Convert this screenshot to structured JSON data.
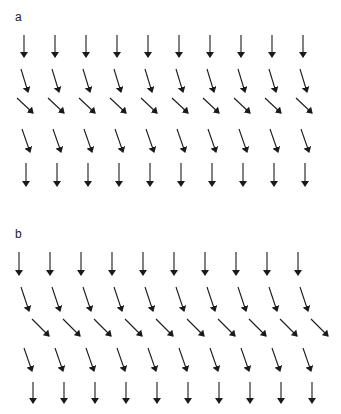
{
  "panels": [
    {
      "label": "a",
      "label_pos": [
        15,
        11
      ],
      "columns": 10,
      "rows": [
        {
          "x0": 24,
          "y0": 35,
          "dx": 0,
          "dy": 22,
          "spacing": 31
        },
        {
          "x0": 21,
          "y0": 69,
          "dx": 7,
          "dy": 23,
          "spacing": 31
        },
        {
          "x0": 17,
          "y0": 98,
          "dx": 16,
          "dy": 15,
          "spacing": 31
        },
        {
          "x0": 22,
          "y0": 129,
          "dx": 8,
          "dy": 23,
          "spacing": 31
        },
        {
          "x0": 26,
          "y0": 163,
          "dx": 0,
          "dy": 23,
          "spacing": 31
        }
      ]
    },
    {
      "label": "b",
      "label_pos": [
        15,
        228
      ],
      "columns": 10,
      "rows": [
        {
          "x0": 19,
          "y0": 252,
          "dx": 0,
          "dy": 23,
          "spacing": 31
        },
        {
          "x0": 21,
          "y0": 287,
          "dx": 8,
          "dy": 24,
          "spacing": 31
        },
        {
          "x0": 32,
          "y0": 319,
          "dx": 17,
          "dy": 17,
          "spacing": 31
        },
        {
          "x0": 24,
          "y0": 348,
          "dx": 8,
          "dy": 23,
          "spacing": 31
        },
        {
          "x0": 33,
          "y0": 382,
          "dx": 0,
          "dy": 21,
          "spacing": 31
        }
      ]
    }
  ],
  "colors": {
    "arrow": "#1a1a1a",
    "background": "#ffffff"
  }
}
